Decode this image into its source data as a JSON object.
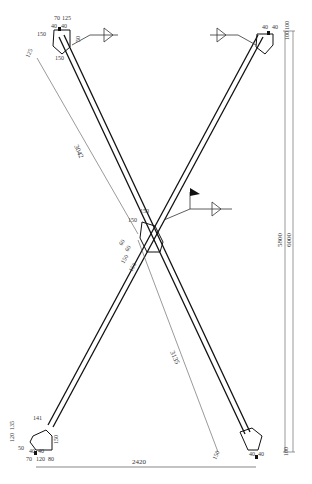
{
  "drawing": {
    "type": "X-bracing elevation",
    "colors": {
      "line": "#111111",
      "dim_line": "#555555",
      "text": "#333333"
    }
  },
  "dimensions": {
    "overall_width": "2420",
    "height_inner": "5800",
    "height_outer": "6000",
    "bottom_offset": "100",
    "top_offset": "100",
    "diagonal_upper": "3042",
    "diagonal_lower": "3135"
  },
  "top_left_node": {
    "d1": "70",
    "d2": "125",
    "d3": "40",
    "d4": "40",
    "d5": "150",
    "d6": "150",
    "d7": "50",
    "d8": "50",
    "d9": "125"
  },
  "top_right_node": {
    "d1": "40",
    "d2": "40",
    "d3": "100"
  },
  "center_node": {
    "d1": "150",
    "d2": "150",
    "d3": "60",
    "d4": "60",
    "d5": "150",
    "d6": "150"
  },
  "bottom_left_node": {
    "d1": "141",
    "d2": "120",
    "d3": "135",
    "d4": "40",
    "d5": "40",
    "d6": "70",
    "d7": "120",
    "d8": "80",
    "d9": "50",
    "d10": "150"
  },
  "bottom_right_node": {
    "d1": "40",
    "d2": "40",
    "d3": "150"
  }
}
